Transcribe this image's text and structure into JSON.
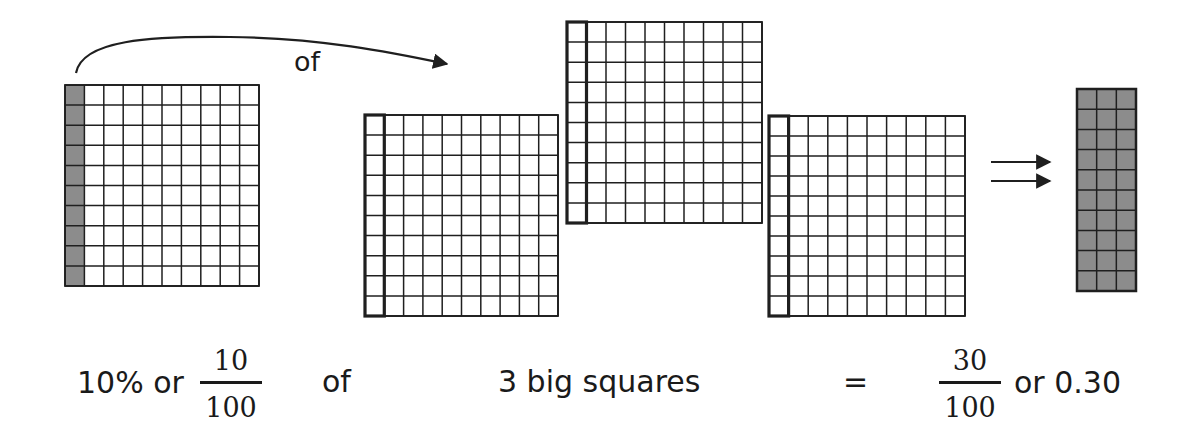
{
  "diagram": {
    "arrow_label": "of",
    "colors": {
      "line": "#1f1f1f",
      "shade": "#8c8c8c",
      "background": "#ffffff"
    },
    "grids": [
      {
        "id": "tenth-of-square",
        "x": 65,
        "y": 85,
        "w": 194,
        "h": 201,
        "rows": 10,
        "cols": 10,
        "shaded_cols": 1,
        "outlined_cols": 0
      },
      {
        "id": "big-square-1",
        "x": 365,
        "y": 115,
        "w": 193,
        "h": 201,
        "rows": 10,
        "cols": 10,
        "shaded_cols": 0,
        "outlined_cols": 1
      },
      {
        "id": "big-square-2",
        "x": 567,
        "y": 22,
        "w": 195,
        "h": 201,
        "rows": 10,
        "cols": 10,
        "shaded_cols": 0,
        "outlined_cols": 1
      },
      {
        "id": "big-square-3",
        "x": 769,
        "y": 116,
        "w": 196,
        "h": 200,
        "rows": 10,
        "cols": 10,
        "shaded_cols": 0,
        "outlined_cols": 1
      },
      {
        "id": "result-strip",
        "x": 1077,
        "y": 89,
        "w": 59,
        "h": 202,
        "rows": 10,
        "cols": 3,
        "shaded_cols": 3,
        "outlined_cols": 0
      }
    ],
    "equation": {
      "part1_text": "10% or",
      "fraction1": {
        "numerator": "10",
        "denominator": "100"
      },
      "of_text": "of",
      "big_squares_text": "3 big squares",
      "equals": "=",
      "fraction2": {
        "numerator": "30",
        "denominator": "100"
      },
      "result_text": "or 0.30"
    }
  }
}
